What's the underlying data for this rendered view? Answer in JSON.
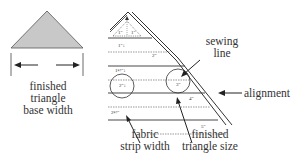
{
  "left_figure": {
    "caption_lines": [
      "finished",
      "triangle",
      "base width"
    ],
    "triangle_fill": "#c8c8c8"
  },
  "right_figure": {
    "strip_labels": [
      "1\"",
      "1½\"",
      "2\"",
      "2½\""
    ],
    "triangle_size_labels": [
      "1\"",
      "1\"",
      "2\"",
      "3\"",
      "4\"",
      "5\""
    ],
    "callouts": {
      "sewing_line": [
        "sewing",
        "line"
      ],
      "alignment": "alignment",
      "fabric_strip_width": [
        "fabric",
        "strip width"
      ],
      "finished_triangle_size": [
        "finished",
        "triangle size"
      ]
    }
  }
}
